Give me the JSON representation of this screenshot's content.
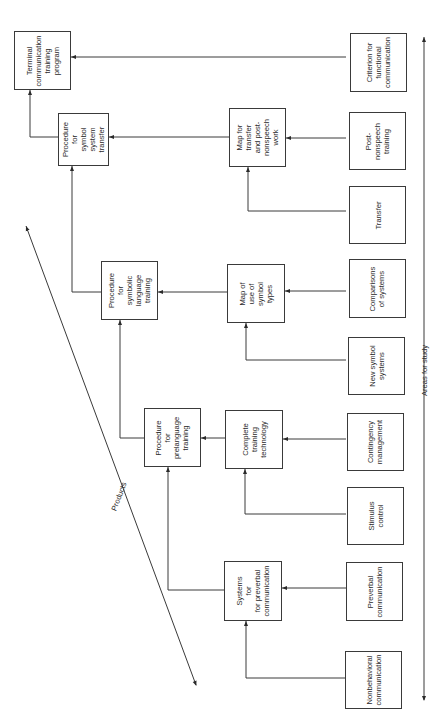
{
  "diagram": {
    "type": "flow diagram (rotated 90°)",
    "products_axis_label": "Products",
    "areas_axis_label": "Areas for study",
    "products": [
      {
        "id": "terminal",
        "label": "Terminal\ncommunication\ntraining\nprogram"
      },
      {
        "id": "proc-transfer",
        "label": "Procedure\nfor\nsymbol\nsystem\ntransfer"
      },
      {
        "id": "proc-symbolic",
        "label": "Procedure\nfor\nsymbolic\nlanguage\ntraining"
      },
      {
        "id": "proc-prelanguage",
        "label": "Procedure\nfor\nprelanguage\ntraining"
      },
      {
        "id": "systems-preverbal",
        "label": "Systems\nfor\nfor preverbal\ncommunication"
      }
    ],
    "intermediate": [
      {
        "id": "map-transfer",
        "label": "Map for\ntransfer\nand post-\nnonspeech\nwork"
      },
      {
        "id": "map-symbol",
        "label": "Map of\nuse of\nsymbol\ntypes"
      },
      {
        "id": "complete-tech",
        "label": "Complete\ntraining\ntechnology"
      }
    ],
    "areas": [
      {
        "id": "criterion",
        "label": "Criterion for\nfunctional\ncommunication"
      },
      {
        "id": "post-nonspeech",
        "label": "Post-\nnonspeech\ntraining"
      },
      {
        "id": "transfer",
        "label": "Transfer"
      },
      {
        "id": "comparisons",
        "label": "Comparisons\nof systems"
      },
      {
        "id": "new-symbol",
        "label": "New symbol\nsystems"
      },
      {
        "id": "contingency",
        "label": "Contingency\nmanagement"
      },
      {
        "id": "stimulus",
        "label": "Stimulus\ncontrol"
      },
      {
        "id": "preverbal",
        "label": "Preverbal\ncommunication"
      },
      {
        "id": "nonbehavioral",
        "label": "Nonbehavioral\ncommunication"
      }
    ],
    "connections": [
      {
        "from": "criterion",
        "to": "terminal"
      },
      {
        "from": "proc-transfer",
        "to": "terminal"
      },
      {
        "from": "map-transfer",
        "to": "proc-transfer"
      },
      {
        "from": "proc-symbolic",
        "to": "proc-transfer"
      },
      {
        "from": "post-nonspeech",
        "to": "map-transfer"
      },
      {
        "from": "transfer",
        "to": "map-transfer"
      },
      {
        "from": "map-symbol",
        "to": "proc-symbolic"
      },
      {
        "from": "proc-prelanguage",
        "to": "proc-symbolic"
      },
      {
        "from": "comparisons",
        "to": "map-symbol"
      },
      {
        "from": "new-symbol",
        "to": "map-symbol"
      },
      {
        "from": "complete-tech",
        "to": "proc-prelanguage"
      },
      {
        "from": "systems-preverbal",
        "to": "proc-prelanguage"
      },
      {
        "from": "contingency",
        "to": "complete-tech"
      },
      {
        "from": "stimulus",
        "to": "complete-tech"
      },
      {
        "from": "preverbal",
        "to": "systems-preverbal"
      },
      {
        "from": "nonbehavioral",
        "to": "systems-preverbal"
      }
    ]
  }
}
